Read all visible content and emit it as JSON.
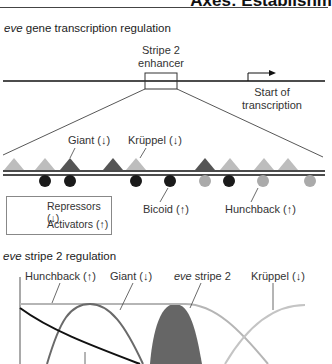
{
  "header": {
    "title_fragment": "Axes: Establishm"
  },
  "panel_a": {
    "title_italic": "eve",
    "title_rest": " gene transcription regulation",
    "enhancer_label_line1": "Stripe 2",
    "enhancer_label_line2": "enhancer",
    "start_label_line1": "Start of",
    "start_label_line2": "transcription",
    "labels": {
      "giant": "Giant (↓)",
      "kruppel": "Krüppel (↓)",
      "bicoid": "Bicoid (↑)",
      "hunchback": "Hunchback (↑)"
    },
    "legend": {
      "repressors": "Repressors (↓)",
      "activators": "Activators (↑)"
    },
    "triangles": [
      {
        "x": 14,
        "shade": "light"
      },
      {
        "x": 45,
        "shade": "light"
      },
      {
        "x": 70,
        "shade": "dark"
      },
      {
        "x": 113,
        "shade": "dark"
      },
      {
        "x": 136,
        "shade": "light"
      },
      {
        "x": 205,
        "shade": "dark"
      },
      {
        "x": 230,
        "shade": "light"
      },
      {
        "x": 264,
        "shade": "light"
      },
      {
        "x": 288,
        "shade": "light"
      }
    ],
    "circles": [
      {
        "x": 45,
        "shade": "dark"
      },
      {
        "x": 70,
        "shade": "dark"
      },
      {
        "x": 136,
        "shade": "dark"
      },
      {
        "x": 170,
        "shade": "dark"
      },
      {
        "x": 205,
        "shade": "light"
      },
      {
        "x": 229,
        "shade": "dark"
      },
      {
        "x": 263,
        "shade": "light"
      },
      {
        "x": 310,
        "shade": "light"
      }
    ]
  },
  "panel_b": {
    "title_italic": "eve",
    "title_rest": " stripe 2 regulation",
    "labels": {
      "hunchback": "Hunchback (↑)",
      "giant": "Giant (↓)",
      "eve_italic": "eve",
      "eve_rest": " stripe 2",
      "kruppel": "Krüppel (↓)"
    }
  },
  "colors": {
    "dark_factor": "#555555",
    "light_factor": "#bdbdbd",
    "activator_dark": "#1a1a1a",
    "activator_light": "#aaaaaa",
    "eve_fill": "#666666",
    "giant_curve": "#6a6a6a",
    "bicoid_curve": "#111111",
    "hunchback_curve": "#b5b5b5",
    "kruppel_curve": "#c4c4c4"
  }
}
